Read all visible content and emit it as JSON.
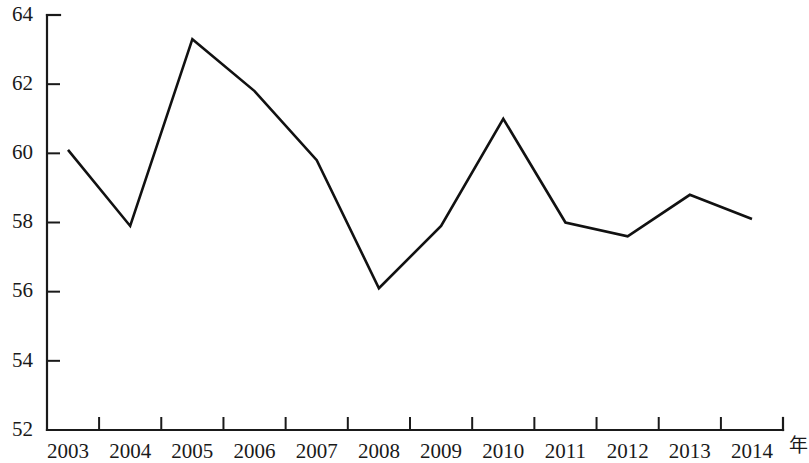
{
  "chart_data": {
    "type": "line",
    "title": "",
    "subtitle": "",
    "xlabel": "年",
    "ylabel": "",
    "categories": [
      "2003",
      "2004",
      "2005",
      "2006",
      "2007",
      "2008",
      "2009",
      "2010",
      "2011",
      "2012",
      "2013",
      "2014"
    ],
    "values": [
      60.1,
      57.9,
      63.3,
      61.8,
      59.8,
      56.1,
      57.9,
      61.0,
      58.0,
      57.6,
      58.8,
      58.1
    ],
    "series": [
      {
        "name": "",
        "values": [
          60.1,
          57.9,
          63.3,
          61.8,
          59.8,
          56.1,
          57.9,
          61.0,
          58.0,
          57.6,
          58.8,
          58.1
        ]
      }
    ],
    "ylim": [
      52,
      64
    ],
    "xlim": [
      "2003",
      "2014"
    ],
    "yticks": [
      64,
      62,
      60,
      58,
      56,
      54,
      52
    ],
    "ytick_labels": [
      "64",
      "62",
      "60",
      "58",
      "56",
      "54",
      "52"
    ],
    "xtick_labels": [
      "2003",
      "2004",
      "2005",
      "2006",
      "2007",
      "2008",
      "2009",
      "2010",
      "2011",
      "2012",
      "2013",
      "2014"
    ],
    "grid": false,
    "legend": false,
    "legend_position": "none",
    "line_color": "#111111",
    "axis_color": "#1a1a1a",
    "background_color": "#ffffff",
    "annotations": []
  },
  "axis_unit_label": "年"
}
